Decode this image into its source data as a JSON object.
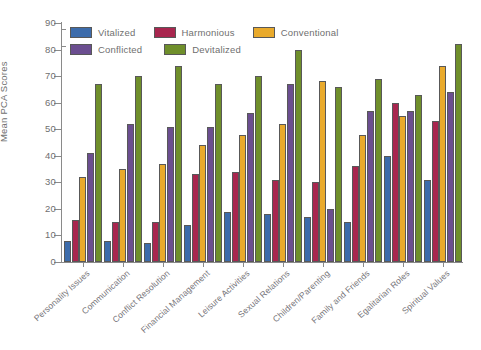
{
  "chart_data": {
    "type": "bar",
    "title": "",
    "xlabel": "",
    "ylabel": "Mean PCA Scores",
    "ylim": [
      0,
      90
    ],
    "yticks": [
      0,
      10,
      20,
      30,
      40,
      50,
      60,
      70,
      80,
      90
    ],
    "grid": false,
    "legend_position": "top-left",
    "categories": [
      "Personality Issues",
      "Communication",
      "Conflict Resolution",
      "Financial Management",
      "Leisure Activities",
      "Sexual Relations",
      "Children/Parenting",
      "Family and Friends",
      "Egalitarian Roles",
      "Spiritual Values"
    ],
    "series": [
      {
        "name": "Vitalized",
        "color": "#3d6cab",
        "values": [
          8,
          8,
          7,
          14,
          19,
          18,
          17,
          15,
          40,
          31
        ]
      },
      {
        "name": "Harmonious",
        "color": "#a8264f",
        "values": [
          16,
          15,
          15,
          33,
          34,
          31,
          30,
          36,
          60,
          53
        ]
      },
      {
        "name": "Conventional",
        "color": "#e9aa2c",
        "values": [
          32,
          35,
          37,
          44,
          48,
          52,
          68,
          48,
          55,
          74
        ]
      },
      {
        "name": "Conflicted",
        "color": "#6b4e90",
        "values": [
          41,
          52,
          51,
          51,
          56,
          67,
          20,
          57,
          57,
          64
        ]
      },
      {
        "name": "Devitalized",
        "color": "#6f8f2b",
        "values": [
          67,
          70,
          74,
          67,
          70,
          80,
          66,
          69,
          63,
          82
        ]
      }
    ]
  },
  "legend": {
    "rows": [
      [
        "Vitalized",
        "Harmonious",
        "Conventional"
      ],
      [
        "Conflicted",
        "Devitalized"
      ]
    ]
  },
  "axis": {
    "y_title": "Mean PCA Scores"
  }
}
